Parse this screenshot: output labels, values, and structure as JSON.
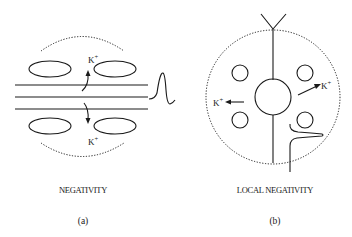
{
  "panels": [
    {
      "id": "a",
      "caption": "NEGATIVITY",
      "sublabel": "(a)",
      "ion_labels": [
        {
          "text": "K",
          "sup": "+",
          "position": "top"
        },
        {
          "text": "K",
          "sup": "+",
          "position": "bottom"
        }
      ],
      "elements": [
        "three parallel horizontal lines (axon)",
        "four ellipses (cells)",
        "two dotted arcs",
        "two curved arrows",
        "action potential spike waveform"
      ]
    },
    {
      "id": "b",
      "caption": "LOCAL NEGATIVITY",
      "sublabel": "(b)",
      "ion_labels": [
        {
          "text": "K",
          "sup": "+",
          "position": "left"
        },
        {
          "text": "K",
          "sup": "+",
          "position": "right"
        }
      ],
      "elements": [
        "large dotted circle",
        "central cell body circle",
        "four small circles",
        "vertical axon/dendrite line",
        "Y-shaped dendrite top",
        "two straight arrows",
        "recording waveform"
      ]
    }
  ],
  "colors": {
    "stroke": "#1a1a1a",
    "background": "#ffffff"
  }
}
